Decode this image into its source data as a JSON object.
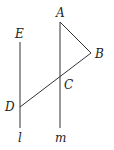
{
  "diagram": {
    "lines": {
      "l": {
        "label": "l",
        "x1": 20,
        "y1": 42,
        "x2": 20,
        "y2": 128
      },
      "m": {
        "label": "m",
        "x1": 60,
        "y1": 22,
        "x2": 60,
        "y2": 128
      },
      "AB": {
        "x1": 60,
        "y1": 22,
        "x2": 91,
        "y2": 53
      },
      "BD": {
        "x1": 91,
        "y1": 53,
        "x2": 20,
        "y2": 107
      }
    },
    "points": {
      "A": {
        "label": "A",
        "x": 56,
        "y": 17
      },
      "B": {
        "label": "B",
        "x": 95,
        "y": 58
      },
      "C": {
        "label": "C",
        "x": 64,
        "y": 88
      },
      "D": {
        "label": "D",
        "x": 5,
        "y": 111
      },
      "E": {
        "label": "E",
        "x": 15,
        "y": 38
      }
    },
    "line_labels": {
      "l": {
        "label": "l",
        "x": 18,
        "y": 142
      },
      "m": {
        "label": "m",
        "x": 55,
        "y": 142
      }
    }
  }
}
